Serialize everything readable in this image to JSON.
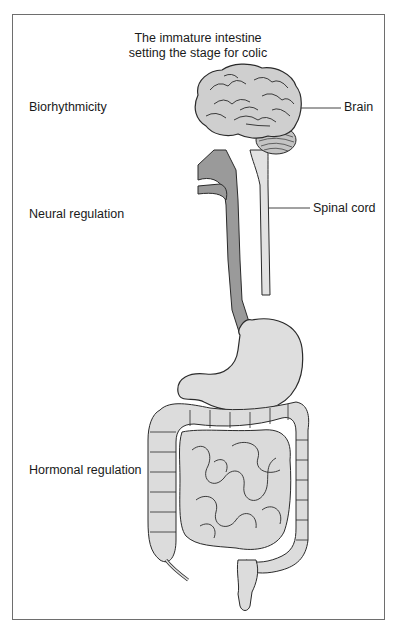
{
  "figure": {
    "title_line1": "The immature intestine",
    "title_line2": "setting the stage for colic",
    "left_labels": [
      {
        "text": "Biorhythmicity",
        "y": 101
      },
      {
        "text": "Neural regulation",
        "y": 208
      },
      {
        "text": "Hormonal regulation",
        "y": 464
      }
    ],
    "right_labels": [
      {
        "text": "Brain",
        "y": 101
      },
      {
        "text": "Spinal cord",
        "y": 203
      }
    ],
    "colors": {
      "frame": "#6e6e6e",
      "organ_fill": "#dedede",
      "esophagus_fill": "#9a9a9a",
      "outline": "#2a2a2a",
      "text": "#1a1a1a"
    }
  }
}
